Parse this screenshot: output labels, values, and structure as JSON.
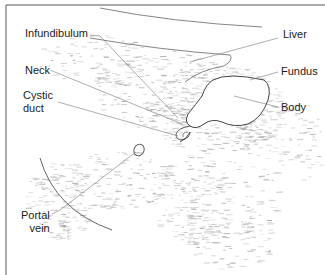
{
  "figure": {
    "type": "ultrasound-schematic",
    "labels": {
      "infundibulum": "Infundibulum",
      "neck": "Neck",
      "cystic_duct": "Cystic\nduct",
      "portal_vein": "Portal\nvein",
      "liver": "Liver",
      "fundus": "Fundus",
      "body": "Body"
    },
    "colors": {
      "line": "#555555",
      "speckle": "#9a9a9a",
      "text": "#1a1a1a",
      "border": "#444444"
    }
  }
}
